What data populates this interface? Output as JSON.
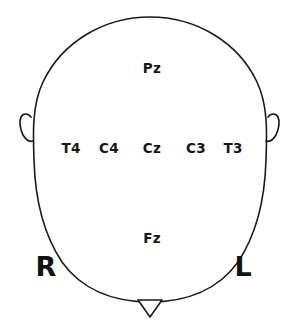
{
  "diagram": {
    "stroke_color": "#1a1a1a",
    "background_color": "#ffffff",
    "text_color": "#161616",
    "head": {
      "shape": "oval",
      "center_x": 150,
      "center_y": 163,
      "radius_x": 117,
      "radius_y": 147
    },
    "nose": {
      "name": "nose-marker",
      "shape": "triangle-pointing-down",
      "center_x": 150,
      "top_y": 300,
      "tip_y": 317,
      "half_width": 12
    },
    "ears": [
      {
        "name": "ear-right-side",
        "side": "right-of-patient",
        "x": 22,
        "y": 130
      },
      {
        "name": "ear-left-side",
        "side": "left-of-patient",
        "x": 278,
        "y": 130
      }
    ],
    "electrodes": [
      {
        "label": "Pz",
        "x": 152,
        "y": 69,
        "row": "posterior"
      },
      {
        "label": "T4",
        "x": 71,
        "y": 149,
        "row": "central"
      },
      {
        "label": "C4",
        "x": 109,
        "y": 149,
        "row": "central"
      },
      {
        "label": "Cz",
        "x": 152,
        "y": 149,
        "row": "central"
      },
      {
        "label": "C3",
        "x": 196,
        "y": 149,
        "row": "central"
      },
      {
        "label": "T3",
        "x": 233,
        "y": 149,
        "row": "central"
      },
      {
        "label": "Fz",
        "x": 152,
        "y": 239,
        "row": "anterior"
      }
    ],
    "orientation_markers": [
      {
        "label": "R",
        "x": 46,
        "y": 266,
        "meaning": "right"
      },
      {
        "label": "L",
        "x": 243,
        "y": 266,
        "meaning": "left"
      }
    ]
  }
}
